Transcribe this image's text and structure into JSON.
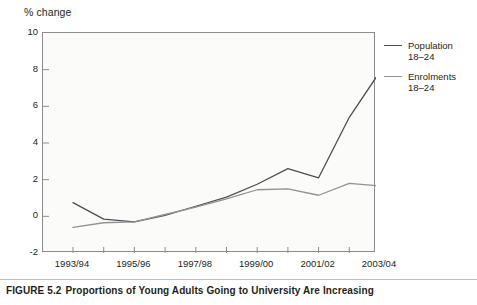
{
  "figure": {
    "caption_number": "FIGURE 5.2",
    "caption_text": "Proportions of Young Adults Going to University Are Increasing"
  },
  "chart_data": {
    "type": "line",
    "title": "",
    "ylabel": "% change",
    "xlabel": "",
    "ylim": [
      -2,
      10
    ],
    "yticks": [
      10,
      8,
      6,
      4,
      2,
      0,
      -2
    ],
    "ytick_labels": [
      "10",
      "8",
      "6",
      "4",
      "2",
      "0",
      "-2"
    ],
    "grid": false,
    "legend_position": "right",
    "categories": [
      "1993/94",
      "1994/95",
      "1995/96",
      "1996/97",
      "1997/98",
      "1998/99",
      "1999/00",
      "2000/01",
      "2001/02",
      "2002/03",
      "2003/04"
    ],
    "xtick_labels_shown": [
      "1993/94",
      "1995/96",
      "1997/98",
      "1999/00",
      "2001/02",
      "2003/04"
    ],
    "series": [
      {
        "name": "Population 18–24",
        "label_line1": "Population",
        "label_line2": "18–24",
        "color": "#4f4f4f",
        "values": [
          0.75,
          -0.15,
          -0.3,
          0.05,
          0.55,
          1.05,
          1.75,
          2.6,
          2.1,
          5.4,
          7.9
        ]
      },
      {
        "name": "Enrolments 18–24",
        "label_line1": "Enrolments",
        "label_line2": "18–24",
        "color": "#8f9296",
        "values": [
          -0.6,
          -0.35,
          -0.3,
          0.1,
          0.5,
          0.95,
          1.45,
          1.5,
          1.15,
          1.8,
          1.65
        ]
      }
    ]
  }
}
